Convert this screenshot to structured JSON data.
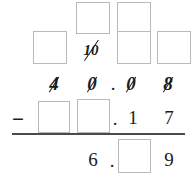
{
  "problem": {
    "type": "vertical-subtraction-with-regrouping",
    "operator": "−",
    "minuend_display": [
      "4",
      "0",
      ".",
      "0",
      "8"
    ],
    "subtrahend_display": [
      "",
      "",
      ".",
      "1",
      "7"
    ],
    "difference_display": [
      "6",
      ".",
      "",
      "9"
    ],
    "regroup_note": "10"
  },
  "regroup_row_top": {
    "boxes": [
      {
        "id": "regroup-top-1",
        "value": ""
      },
      {
        "id": "regroup-top-2",
        "value": ""
      }
    ]
  },
  "regroup_row_mid": {
    "box_left": {
      "id": "regroup-mid-left",
      "value": ""
    },
    "crossed_ten": "10",
    "box_right_1": {
      "id": "regroup-mid-right-1",
      "value": ""
    },
    "box_right_2": {
      "id": "regroup-mid-right-2",
      "value": ""
    }
  },
  "minuend_row": {
    "thousands_digit": "4",
    "ones_digit": "0",
    "decimal_point": ".",
    "tenths_digit": "0",
    "hundredths_digit": "8"
  },
  "subtrahend_row": {
    "operator": "−",
    "box_ones": {
      "id": "subtrahend-box-1",
      "value": ""
    },
    "box_units": {
      "id": "subtrahend-box-2",
      "value": ""
    },
    "decimal_point": ".",
    "tenths_digit": "1",
    "hundredths_digit": "7"
  },
  "answer_row": {
    "units_digit": "6",
    "decimal_point": ".",
    "box_tenths": {
      "id": "answer-box-tenths",
      "value": ""
    },
    "hundredths_digit": "9"
  },
  "colors": {
    "ink": "#1c1c1c",
    "box_border": "#b9b9b9",
    "rule": "#4a4a4a",
    "background": "#ffffff"
  }
}
